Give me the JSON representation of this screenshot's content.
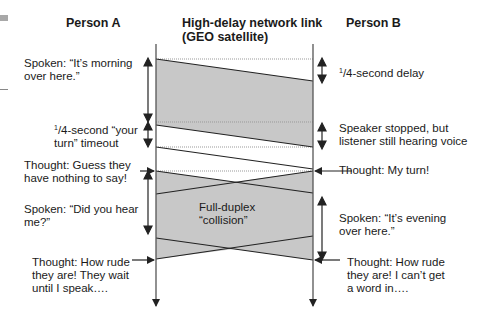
{
  "headers": {
    "person_a": "Person A",
    "link_line1": "High-delay network link",
    "link_line2": "(GEO satellite)",
    "person_b": "Person B"
  },
  "left_annotations": [
    {
      "line1": "Spoken: “It’s morning",
      "line2": "over here.”"
    },
    {
      "line1_sup": "1",
      "line1_rest": "/4-second “your",
      "line2": "turn” timeout"
    },
    {
      "line1": "Thought: Guess they",
      "line2": "have nothing to say!"
    },
    {
      "line1": "Spoken: “Did you hear",
      "line2": "me?”"
    },
    {
      "line1": "Thought: How rude",
      "line2": "they are! They wait",
      "line3": "until I speak…."
    }
  ],
  "right_annotations": [
    {
      "sup": "1",
      "rest": "/4-second delay"
    },
    {
      "line1": "Speaker stopped, but",
      "line2": "listener still hearing voice"
    },
    {
      "line1": "Thought: My turn!"
    },
    {
      "line1": "Spoken: “It’s evening",
      "line2": "over here.”"
    },
    {
      "line1": "Thought: How rude",
      "line2": "they are! I can’t get",
      "line3": "a word in…."
    }
  ],
  "center_label": {
    "line1": "Full-duplex",
    "line2": "“collision”"
  },
  "colors": {
    "shade": "#c8c8c8",
    "line": "#222222",
    "dotted": "#999999",
    "edge_mark": "#9a9a9a"
  }
}
